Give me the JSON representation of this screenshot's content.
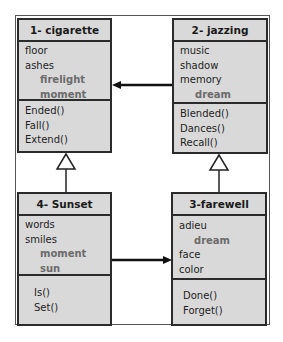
{
  "classes": {
    "c1": {
      "title": "1- cigarette",
      "attributes": [
        {
          "name": "floor",
          "sub": false
        },
        {
          "name": "ashes",
          "sub": false
        },
        {
          "name": "firelight",
          "sub": true
        },
        {
          "name": "moment",
          "sub": true
        }
      ],
      "operations": [
        "Ended()",
        "Fall()",
        "Extend()"
      ]
    },
    "c2": {
      "title": "2- jazzing",
      "attributes": [
        {
          "name": "music",
          "sub": false
        },
        {
          "name": "shadow",
          "sub": false
        },
        {
          "name": "memory",
          "sub": false
        },
        {
          "name": "dream",
          "sub": true
        }
      ],
      "operations": [
        "Blended()",
        "Dances()",
        "Recall()"
      ]
    },
    "c3": {
      "title": "3-farewell",
      "attributes": [
        {
          "name": "adieu",
          "sub": false
        },
        {
          "name": "dream",
          "sub": true
        },
        {
          "name": "face",
          "sub": false
        },
        {
          "name": "color",
          "sub": false
        }
      ],
      "operations": [
        "Done()",
        "Forget()"
      ]
    },
    "c4": {
      "title": "4- Sunset",
      "attributes": [
        {
          "name": "words",
          "sub": false
        },
        {
          "name": "smiles",
          "sub": false
        },
        {
          "name": "moment",
          "sub": true
        },
        {
          "name": "sun",
          "sub": true
        }
      ],
      "operations": [
        "Is()",
        "Set()"
      ]
    }
  },
  "relations": [
    {
      "from": "2- jazzing",
      "to": "1- cigarette",
      "type": "association-arrow"
    },
    {
      "from": "4- Sunset",
      "to": "3-farewell",
      "type": "association-arrow"
    },
    {
      "from": "4- Sunset",
      "to": "1- cigarette",
      "type": "generalization"
    },
    {
      "from": "3-farewell",
      "to": "2- jazzing",
      "type": "generalization"
    }
  ],
  "colors": {
    "box_fill": "#d9d9d9",
    "border": "#2b2b2b",
    "sub_text": "#6b6b6b"
  }
}
